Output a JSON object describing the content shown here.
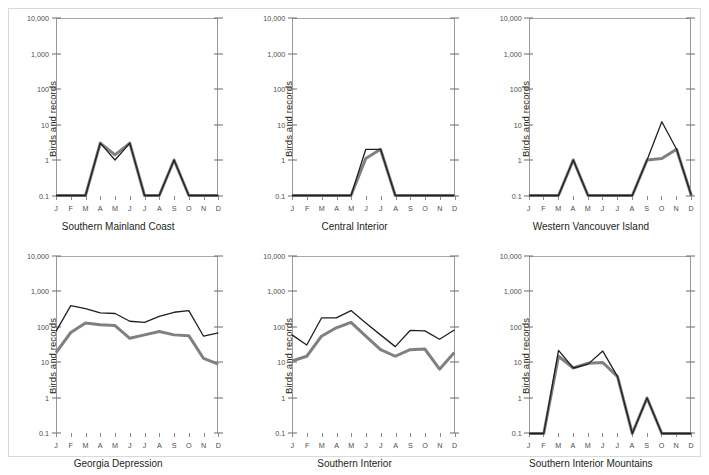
{
  "figure": {
    "ylabel": "Birds and records",
    "x_tick_labels": [
      "J",
      "F",
      "M",
      "A",
      "M",
      "J",
      "J",
      "A",
      "S",
      "O",
      "N",
      "D"
    ],
    "y_tick_labels": [
      "10,000",
      "1,000",
      "100",
      "10",
      "1",
      "0.1"
    ],
    "y_tick_values": [
      10000,
      1000,
      100,
      10,
      1,
      0.1
    ],
    "series_colors": {
      "records": "#231f20",
      "birds": "#808080"
    },
    "border_color": "#d9d9d9",
    "gridline_color": "#a8a8a8"
  },
  "chart_data": [
    {
      "type": "line",
      "title": "Southern Mainland Coast",
      "xlabel": "",
      "ylabel": "Birds and records",
      "x": [
        "J",
        "F",
        "M",
        "A",
        "M",
        "J",
        "J",
        "A",
        "S",
        "O",
        "N",
        "D"
      ],
      "ylim": [
        0.1,
        10000
      ],
      "yscale": "log",
      "grid": "top-only",
      "series": [
        {
          "name": "records",
          "color": "#231f20",
          "values": [
            0.1,
            0.1,
            0.1,
            3,
            1,
            3,
            0.1,
            0.1,
            1,
            0.1,
            0.1,
            0.1
          ]
        },
        {
          "name": "birds",
          "color": "#808080",
          "values": [
            0.1,
            0.1,
            0.1,
            3,
            1.4,
            3,
            0.1,
            0.1,
            1,
            0.1,
            0.1,
            0.1
          ]
        }
      ]
    },
    {
      "type": "line",
      "title": "Central Interior",
      "xlabel": "",
      "ylabel": "Birds and records",
      "x": [
        "J",
        "F",
        "M",
        "A",
        "M",
        "J",
        "J",
        "A",
        "S",
        "O",
        "N",
        "D"
      ],
      "ylim": [
        0.1,
        10000
      ],
      "yscale": "log",
      "grid": "top-only",
      "series": [
        {
          "name": "records",
          "color": "#231f20",
          "values": [
            0.1,
            0.1,
            0.1,
            0.1,
            0.1,
            2,
            2,
            0.1,
            0.1,
            0.1,
            0.1,
            0.1
          ]
        },
        {
          "name": "birds",
          "color": "#808080",
          "values": [
            0.1,
            0.1,
            0.1,
            0.1,
            0.1,
            1.1,
            2,
            0.1,
            0.1,
            0.1,
            0.1,
            0.1
          ]
        }
      ]
    },
    {
      "type": "line",
      "title": "Western Vancouver Island",
      "xlabel": "",
      "ylabel": "Birds and records",
      "x": [
        "J",
        "F",
        "M",
        "A",
        "M",
        "J",
        "J",
        "A",
        "S",
        "O",
        "N",
        "D"
      ],
      "ylim": [
        0.1,
        10000
      ],
      "yscale": "log",
      "grid": "top-only",
      "series": [
        {
          "name": "records",
          "color": "#231f20",
          "values": [
            0.1,
            0.1,
            0.1,
            1,
            0.1,
            0.1,
            0.1,
            0.1,
            1,
            12,
            2,
            0.1
          ]
        },
        {
          "name": "birds",
          "color": "#808080",
          "values": [
            0.1,
            0.1,
            0.1,
            1,
            0.1,
            0.1,
            0.1,
            0.1,
            1,
            1.1,
            2,
            0.1
          ]
        }
      ]
    },
    {
      "type": "line",
      "title": "Georgia Depression",
      "xlabel": "",
      "ylabel": "Birds and records",
      "x": [
        "J",
        "F",
        "M",
        "A",
        "M",
        "J",
        "J",
        "A",
        "S",
        "O",
        "N",
        "D"
      ],
      "ylim": [
        0.1,
        10000
      ],
      "yscale": "log",
      "grid": "top-only",
      "series": [
        {
          "name": "records",
          "color": "#231f20",
          "values": [
            75,
            400,
            330,
            250,
            240,
            145,
            135,
            200,
            260,
            290,
            55,
            68
          ]
        },
        {
          "name": "birds",
          "color": "#808080",
          "values": [
            19,
            70,
            130,
            115,
            110,
            48,
            60,
            75,
            60,
            57,
            13,
            9
          ]
        }
      ]
    },
    {
      "type": "line",
      "title": "Southern Interior",
      "xlabel": "",
      "ylabel": "Birds and records",
      "x": [
        "J",
        "F",
        "M",
        "A",
        "M",
        "J",
        "J",
        "A",
        "S",
        "O",
        "N",
        "D"
      ],
      "ylim": [
        0.1,
        10000
      ],
      "yscale": "log",
      "grid": "top-only",
      "series": [
        {
          "name": "records",
          "color": "#231f20",
          "values": [
            60,
            31,
            180,
            180,
            290,
            130,
            60,
            28,
            80,
            78,
            45,
            82
          ]
        },
        {
          "name": "birds",
          "color": "#808080",
          "values": [
            11,
            15,
            55,
            95,
            135,
            55,
            23,
            15,
            23,
            24,
            6.5,
            19
          ]
        }
      ]
    },
    {
      "type": "line",
      "title": "Southern Interior Mountains",
      "xlabel": "",
      "ylabel": "Birds and records",
      "x": [
        "J",
        "F",
        "M",
        "A",
        "M",
        "J",
        "J",
        "A",
        "S",
        "O",
        "N",
        "D"
      ],
      "ylim": [
        0.1,
        10000
      ],
      "yscale": "log",
      "grid": "top-only",
      "series": [
        {
          "name": "records",
          "color": "#231f20",
          "values": [
            0.1,
            0.1,
            22,
            7,
            9,
            21,
            4,
            0.1,
            1,
            0.1,
            0.1,
            0.1
          ]
        },
        {
          "name": "birds",
          "color": "#808080",
          "values": [
            0.1,
            0.1,
            15,
            7,
            9.5,
            10,
            4,
            0.1,
            1,
            0.1,
            0.1,
            0.1
          ]
        }
      ]
    }
  ]
}
